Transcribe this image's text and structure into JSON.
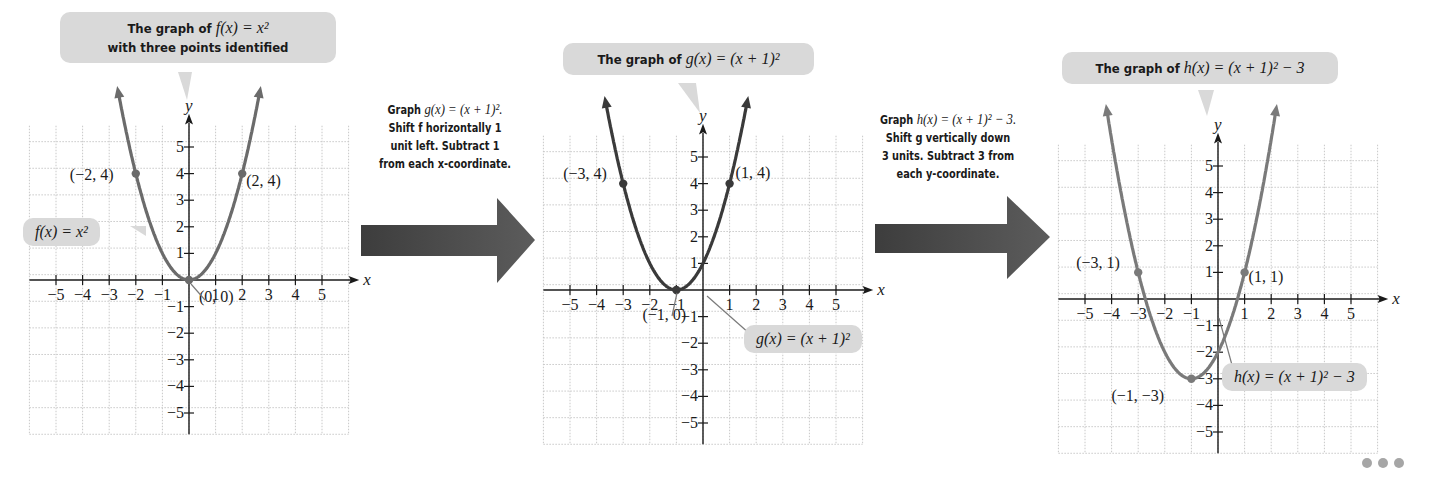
{
  "panels": [
    {
      "id": "f",
      "callout_title": {
        "prefix": "The graph of ",
        "expr": "f(x) = x²",
        "line2": "with three points identified"
      },
      "function_label": "f(x) = x²",
      "axis": {
        "x_label": "x",
        "y_label": "y",
        "x_ticks": [
          "−5",
          "−4",
          "−3",
          "−2",
          "−1",
          "1",
          "2",
          "3",
          "4",
          "5"
        ],
        "y_ticks": [
          "5",
          "4",
          "3",
          "2",
          "1",
          "−1",
          "−2",
          "−3",
          "−4",
          "−5"
        ]
      },
      "points": [
        {
          "x": -2,
          "y": 4,
          "label": "(−2, 4)"
        },
        {
          "x": 0,
          "y": 0,
          "label": "(0, 0)"
        },
        {
          "x": 2,
          "y": 4,
          "label": "(2, 4)"
        }
      ],
      "curve_color": "#6b6b6b"
    },
    {
      "id": "g",
      "callout_title": {
        "prefix": "The graph of ",
        "expr": "g(x) = (x + 1)²"
      },
      "function_label": "g(x) = (x + 1)²",
      "axis": {
        "x_label": "x",
        "y_label": "y"
      },
      "points": [
        {
          "x": -3,
          "y": 4,
          "label": "(−3, 4)"
        },
        {
          "x": -1,
          "y": 0,
          "label": "(−1, 0)"
        },
        {
          "x": 1,
          "y": 4,
          "label": "(1, 4)"
        }
      ],
      "curve_color": "#3a3a3a"
    },
    {
      "id": "h",
      "callout_title": {
        "prefix": "The graph of ",
        "expr": "h(x) = (x + 1)² − 3"
      },
      "function_label": "h(x) = (x + 1)² − 3",
      "axis": {
        "x_label": "x",
        "y_label": "y"
      },
      "points": [
        {
          "x": -3,
          "y": 1,
          "label": "(−3, 1)"
        },
        {
          "x": -1,
          "y": -3,
          "label": "(−1, −3)"
        },
        {
          "x": 1,
          "y": 1,
          "label": "(1, 1)"
        }
      ],
      "curve_color": "#7a7a7a"
    }
  ],
  "steps": [
    {
      "line1_prefix": "Graph ",
      "line1_expr": "g(x) = (x + 1)².",
      "line2": "Shift f horizontally 1",
      "line3": "unit left. Subtract 1",
      "line4": "from each x-coordinate."
    },
    {
      "line1_prefix": "Graph ",
      "line1_expr": "h(x) = (x + 1)² − 3.",
      "line2": "Shift g vertically down",
      "line3": "3 units. Subtract 3 from",
      "line4": "each y-coordinate."
    }
  ],
  "colors": {
    "callout_bg": "#d9d9d9",
    "arrow": "#4a4a4a",
    "grid": "#c8c8c8",
    "axis": "#1a1a1a"
  },
  "more_icon": "ellipsis-icon"
}
